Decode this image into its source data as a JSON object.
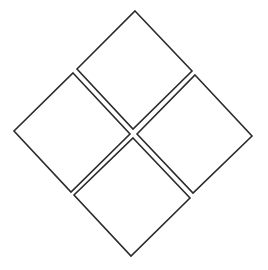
{
  "diagram": {
    "type": "four-diamond-grid",
    "stroke_color": "#2b2b2b",
    "fill_color": "#ffffff",
    "background": "#ffffff",
    "cells": [
      {
        "id": "top",
        "points": "135,11 192,71 133,129 77,69"
      },
      {
        "id": "left",
        "points": "73,73 130,134 71,192 14,131"
      },
      {
        "id": "right",
        "points": "195,75 252,136 193,193 137,134"
      },
      {
        "id": "bottom",
        "points": "133,138 190,198 131,256 74,195"
      }
    ]
  }
}
